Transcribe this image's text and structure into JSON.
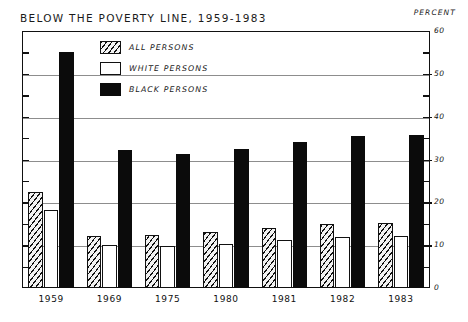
{
  "header": {
    "title": "BELOW THE POVERTY LINE, 1959-1983",
    "percent_label": "PERCENT"
  },
  "legend": {
    "items": [
      {
        "label": "ALL PERSONS",
        "swatch": "hatched",
        "color": "#111111"
      },
      {
        "label": "WHITE PERSONS",
        "swatch": "white",
        "color": "#ffffff"
      },
      {
        "label": "BLACK PERSONS",
        "swatch": "solid",
        "color": "#0b0b0b"
      }
    ]
  },
  "chart_data": {
    "type": "bar",
    "title": "BELOW THE POVERTY LINE, 1959-1983",
    "xlabel": "",
    "ylabel": "PERCENT",
    "ylim": [
      0,
      60
    ],
    "yticks": [
      0,
      10,
      20,
      30,
      40,
      50,
      60
    ],
    "ytick_labels": [
      "0",
      "10",
      "20",
      "30",
      "40",
      "50",
      "60"
    ],
    "grid": true,
    "grid_values": [
      10,
      20,
      30,
      40,
      50
    ],
    "legend_position": "upper-left-inside",
    "categories": [
      "1959",
      "1969",
      "1975",
      "1980",
      "1981",
      "1982",
      "1983"
    ],
    "series": [
      {
        "name": "ALL PERSONS",
        "values": [
          22.4,
          12.1,
          12.3,
          13.0,
          14.0,
          15.0,
          15.2
        ]
      },
      {
        "name": "WHITE PERSONS",
        "values": [
          18.1,
          10.0,
          9.7,
          10.2,
          11.1,
          12.0,
          12.1
        ]
      },
      {
        "name": "BLACK PERSONS",
        "values": [
          55.1,
          32.2,
          31.3,
          32.5,
          34.2,
          35.6,
          35.7
        ]
      }
    ]
  }
}
